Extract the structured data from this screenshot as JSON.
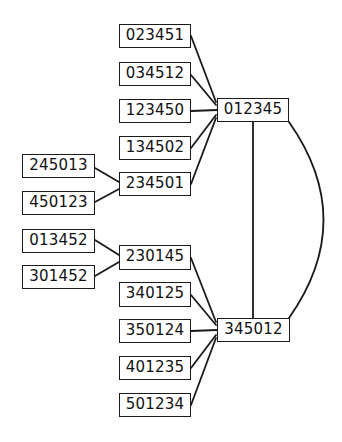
{
  "diagram": {
    "type": "graph",
    "nodes": [
      {
        "id": "023451",
        "label": "023451",
        "x": 119,
        "y": 24,
        "w": 72,
        "h": 24
      },
      {
        "id": "034512",
        "label": "034512",
        "x": 119,
        "y": 62,
        "w": 72,
        "h": 24
      },
      {
        "id": "123450",
        "label": "123450",
        "x": 119,
        "y": 99,
        "w": 72,
        "h": 24
      },
      {
        "id": "134502",
        "label": "134502",
        "x": 119,
        "y": 136,
        "w": 72,
        "h": 24
      },
      {
        "id": "234501",
        "label": "234501",
        "x": 119,
        "y": 172,
        "w": 72,
        "h": 24
      },
      {
        "id": "012345",
        "label": "012345",
        "x": 217,
        "y": 98,
        "w": 72,
        "h": 24
      },
      {
        "id": "245013",
        "label": "245013",
        "x": 22,
        "y": 154,
        "w": 73,
        "h": 24
      },
      {
        "id": "450123",
        "label": "450123",
        "x": 22,
        "y": 191,
        "w": 73,
        "h": 24
      },
      {
        "id": "013452",
        "label": "013452",
        "x": 22,
        "y": 229,
        "w": 73,
        "h": 24
      },
      {
        "id": "301452",
        "label": "301452",
        "x": 22,
        "y": 265,
        "w": 73,
        "h": 24
      },
      {
        "id": "230145",
        "label": "230145",
        "x": 119,
        "y": 245,
        "w": 72,
        "h": 25
      },
      {
        "id": "340125",
        "label": "340125",
        "x": 119,
        "y": 282,
        "w": 72,
        "h": 25
      },
      {
        "id": "350124",
        "label": "350124",
        "x": 119,
        "y": 319,
        "w": 72,
        "h": 24
      },
      {
        "id": "401235",
        "label": "401235",
        "x": 119,
        "y": 356,
        "w": 72,
        "h": 24
      },
      {
        "id": "501234",
        "label": "501234",
        "x": 119,
        "y": 393,
        "w": 72,
        "h": 24
      },
      {
        "id": "345012",
        "label": "345012",
        "x": 217,
        "y": 318,
        "w": 73,
        "h": 24
      }
    ],
    "edges": [
      {
        "from": "023451",
        "to": "012345"
      },
      {
        "from": "034512",
        "to": "012345"
      },
      {
        "from": "123450",
        "to": "012345"
      },
      {
        "from": "134502",
        "to": "012345"
      },
      {
        "from": "234501",
        "to": "012345"
      },
      {
        "from": "245013",
        "to": "234501"
      },
      {
        "from": "450123",
        "to": "234501"
      },
      {
        "from": "013452",
        "to": "230145"
      },
      {
        "from": "301452",
        "to": "230145"
      },
      {
        "from": "230145",
        "to": "345012"
      },
      {
        "from": "340125",
        "to": "345012"
      },
      {
        "from": "350124",
        "to": "345012"
      },
      {
        "from": "401235",
        "to": "345012"
      },
      {
        "from": "501234",
        "to": "345012"
      },
      {
        "from": "012345",
        "to": "345012",
        "style": "straight"
      },
      {
        "from": "012345",
        "to": "345012",
        "style": "curved"
      }
    ]
  }
}
